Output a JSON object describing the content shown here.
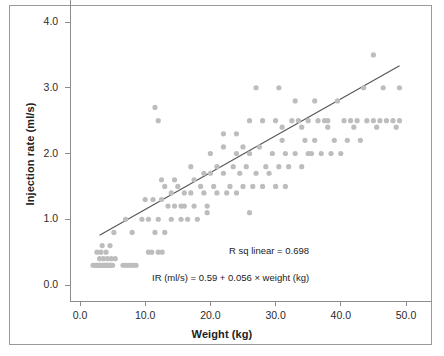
{
  "chart_data": {
    "type": "scatter",
    "title": "",
    "xlabel": "Weight (kg)",
    "ylabel": "Injection rate (ml/s)",
    "xlim": [
      -1.5,
      54.0
    ],
    "ylim": [
      -0.25,
      4.35
    ],
    "xticks": [
      "0.0",
      "10.0",
      "20.0",
      "30.0",
      "40.0",
      "50.0"
    ],
    "xtick_values": [
      0,
      10,
      20,
      30,
      40,
      50
    ],
    "yticks": [
      "0.0",
      "1.0",
      "2.0",
      "3.0",
      "4.0"
    ],
    "ytick_values": [
      0,
      1,
      2,
      3,
      4
    ],
    "grid": false,
    "legend": null,
    "point_color": "#bdbdbd",
    "line_color": "#555555",
    "annotations": [
      {
        "id": "r-squared",
        "text": "R sq linear = 0.698"
      },
      {
        "id": "equation",
        "text": "IR (ml/s) = 0.59 + 0.056 × weight (kg)"
      }
    ],
    "fit": {
      "type": "linear",
      "intercept": 0.59,
      "slope": 0.056,
      "r_squared": 0.698,
      "x_start": 3.0,
      "x_end": 49.0
    },
    "series": [
      {
        "name": "Injection rate vs weight",
        "x": [
          2.0,
          2.3,
          2.5,
          2.6,
          2.8,
          3.0,
          3.0,
          3.2,
          3.4,
          3.5,
          3.6,
          3.8,
          4.0,
          4.0,
          4.2,
          4.4,
          4.5,
          4.6,
          4.8,
          5.0,
          3.0,
          3.6,
          4.2,
          4.8,
          5.4,
          2.6,
          3.2,
          4.0,
          6.6,
          7.0,
          7.4,
          7.8,
          8.2,
          8.6,
          3.4,
          4.6,
          10.5,
          11.0,
          12.0,
          12.6,
          5.2,
          8.0,
          11.5,
          13.0,
          14.0,
          15.5,
          16.5,
          18.0,
          7.0,
          9.5,
          10.5,
          12.0,
          13.5,
          14.5,
          15.5,
          16.0,
          17.5,
          19.5,
          10.0,
          11.2,
          12.5,
          14.0,
          16.0,
          17.0,
          19.0,
          21.0,
          22.5,
          24.0,
          13.0,
          15.0,
          18.5,
          20.5,
          23.0,
          25.0,
          26.5,
          28.0,
          30.0,
          31.5,
          12.5,
          14.5,
          17.5,
          19.0,
          20.0,
          22.0,
          24.5,
          27.0,
          29.0,
          17.0,
          21.0,
          23.5,
          25.5,
          28.5,
          30.5,
          32.0,
          34.0,
          20.0,
          24.0,
          26.0,
          29.5,
          33.0,
          35.5,
          37.0,
          38.5,
          40.0,
          22.0,
          25.0,
          27.5,
          31.0,
          34.5,
          36.0,
          39.0,
          41.0,
          43.0,
          26.0,
          30.0,
          33.5,
          36.5,
          38.0,
          41.5,
          44.0,
          46.0,
          48.0,
          49.0,
          28.0,
          32.5,
          35.0,
          37.5,
          40.5,
          42.5,
          45.0,
          47.0,
          31.0,
          34.0,
          38.0,
          42.0,
          45.5,
          48.5,
          27.0,
          30.5,
          43.5,
          46.5,
          49.0,
          45.0,
          33.0,
          36.0,
          39.5,
          11.5,
          12.0,
          22.0,
          24.0,
          31.5,
          35.0,
          19.5,
          26.0
        ],
        "y": [
          0.3,
          0.3,
          0.3,
          0.3,
          0.3,
          0.3,
          0.3,
          0.3,
          0.3,
          0.3,
          0.3,
          0.3,
          0.3,
          0.3,
          0.3,
          0.3,
          0.3,
          0.3,
          0.3,
          0.3,
          0.4,
          0.4,
          0.4,
          0.4,
          0.4,
          0.5,
          0.5,
          0.5,
          0.3,
          0.3,
          0.3,
          0.3,
          0.3,
          0.3,
          0.6,
          0.6,
          0.5,
          0.5,
          0.5,
          0.5,
          0.8,
          0.8,
          0.8,
          0.8,
          1.0,
          1.0,
          1.0,
          1.0,
          1.0,
          1.0,
          1.0,
          1.0,
          1.2,
          1.2,
          1.2,
          1.2,
          1.2,
          1.2,
          1.3,
          1.3,
          1.3,
          1.4,
          1.4,
          1.4,
          1.4,
          1.4,
          1.4,
          1.4,
          1.5,
          1.5,
          1.5,
          1.5,
          1.5,
          1.5,
          1.5,
          1.5,
          1.5,
          1.5,
          1.6,
          1.6,
          1.6,
          1.7,
          1.7,
          1.7,
          1.7,
          1.7,
          1.7,
          1.8,
          1.8,
          1.8,
          1.8,
          1.8,
          1.8,
          1.8,
          1.8,
          2.0,
          2.0,
          2.0,
          2.0,
          2.0,
          2.0,
          2.0,
          2.0,
          2.0,
          2.1,
          2.1,
          2.1,
          2.2,
          2.2,
          2.2,
          2.2,
          2.2,
          2.2,
          2.5,
          2.5,
          2.5,
          2.5,
          2.5,
          2.5,
          2.5,
          2.5,
          2.5,
          2.5,
          2.5,
          2.5,
          2.5,
          2.5,
          2.5,
          2.5,
          2.5,
          2.5,
          2.4,
          2.4,
          2.4,
          2.4,
          2.4,
          2.4,
          3.0,
          3.0,
          3.0,
          3.0,
          3.0,
          3.5,
          2.8,
          2.8,
          2.8,
          2.7,
          2.5,
          2.3,
          2.3,
          2.0,
          2.0,
          1.1,
          1.1
        ]
      }
    ]
  }
}
